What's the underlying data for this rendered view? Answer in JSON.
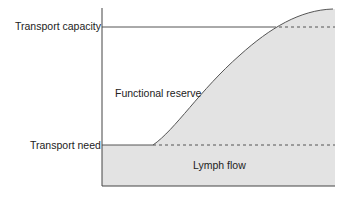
{
  "diagram": {
    "labels": {
      "transport_capacity": "Transport capacity",
      "transport_need": "Transport need",
      "functional_reserve": "Functional reserve",
      "lymph_flow": "Lymph flow"
    },
    "colors": {
      "fill": "#e3e3e3",
      "line": "#555555",
      "text": "#222222"
    }
  }
}
